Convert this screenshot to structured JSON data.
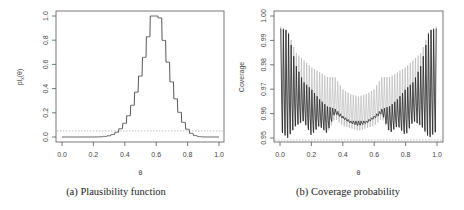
{
  "chart_data": [
    {
      "type": "line",
      "panel": "a",
      "caption": "(a)  Plausibility function",
      "title": "",
      "xlabel": "θ",
      "ylabel": "pl_x(θ)",
      "xlim": [
        0,
        1
      ],
      "ylim": [
        0,
        1
      ],
      "xticks": [
        "0.0",
        "0.2",
        "0.4",
        "0.6",
        "0.8",
        "1.0"
      ],
      "yticks": [
        "0.0",
        "0.2",
        "0.4",
        "0.6",
        "0.8",
        "1.0"
      ],
      "reference_line": {
        "y": 0.05,
        "style": "dotted",
        "color": "#aaaaaa"
      },
      "series": [
        {
          "name": "plausibility",
          "color": "#444444",
          "style": "step",
          "x": [
            0.0,
            0.3,
            0.35,
            0.38,
            0.4,
            0.42,
            0.44,
            0.46,
            0.48,
            0.5,
            0.52,
            0.54,
            0.56,
            0.58,
            0.6,
            0.62,
            0.64,
            0.66,
            0.68,
            0.7,
            0.72,
            0.74,
            0.76,
            0.78,
            0.8,
            0.83,
            0.86,
            1.0
          ],
          "y": [
            0.0,
            0.003,
            0.01,
            0.03,
            0.05,
            0.08,
            0.13,
            0.19,
            0.27,
            0.37,
            0.49,
            0.62,
            0.77,
            1.0,
            1.0,
            0.83,
            0.67,
            0.52,
            0.38,
            0.27,
            0.18,
            0.11,
            0.06,
            0.03,
            0.015,
            0.004,
            0.0,
            0.0
          ]
        }
      ],
      "grid": false,
      "legend": null
    },
    {
      "type": "line",
      "panel": "b",
      "caption": "(b)  Coverage probability",
      "title": "",
      "xlabel": "θ",
      "ylabel": "Coverage",
      "xlim": [
        0,
        1
      ],
      "ylim": [
        0.95,
        1.0
      ],
      "xticks": [
        "0.0",
        "0.2",
        "0.4",
        "0.6",
        "0.8",
        "1.0"
      ],
      "yticks": [
        "0.95",
        "0.96",
        "0.97",
        "0.98",
        "0.99",
        "1.00"
      ],
      "reference_line": {
        "y": 0.95,
        "style": "dotted",
        "color": "#aaaaaa"
      },
      "series": [
        {
          "name": "coverage (upper, grey)",
          "color": "#b0b0b0",
          "envelope_x": [
            0.0,
            0.05,
            0.1,
            0.15,
            0.2,
            0.25,
            0.3,
            0.35,
            0.4,
            0.45,
            0.5,
            0.55,
            0.6,
            0.65,
            0.7,
            0.75,
            0.8,
            0.85,
            0.9,
            0.95,
            1.0
          ],
          "envelope_high": [
            0.996,
            0.994,
            0.985,
            0.982,
            0.979,
            0.977,
            0.975,
            0.975,
            0.97,
            0.968,
            0.967,
            0.968,
            0.97,
            0.975,
            0.975,
            0.977,
            0.979,
            0.982,
            0.985,
            0.994,
            0.996
          ],
          "envelope_low": [
            0.953,
            0.951,
            0.955,
            0.957,
            0.952,
            0.955,
            0.952,
            0.958,
            0.955,
            0.954,
            0.953,
            0.954,
            0.955,
            0.958,
            0.952,
            0.955,
            0.952,
            0.957,
            0.955,
            0.951,
            0.953
          ]
        },
        {
          "name": "coverage (lower, black)",
          "color": "#222222",
          "envelope_x": [
            0.0,
            0.05,
            0.1,
            0.15,
            0.2,
            0.25,
            0.3,
            0.35,
            0.4,
            0.45,
            0.5,
            0.55,
            0.6,
            0.65,
            0.7,
            0.75,
            0.8,
            0.85,
            0.9,
            0.95,
            1.0
          ],
          "envelope_high": [
            0.995,
            0.994,
            0.98,
            0.973,
            0.97,
            0.966,
            0.963,
            0.962,
            0.959,
            0.957,
            0.957,
            0.957,
            0.959,
            0.962,
            0.963,
            0.966,
            0.97,
            0.973,
            0.98,
            0.994,
            0.995
          ],
          "envelope_low": [
            0.953,
            0.95,
            0.955,
            0.957,
            0.951,
            0.955,
            0.952,
            0.96,
            0.958,
            0.956,
            0.955,
            0.956,
            0.958,
            0.96,
            0.952,
            0.955,
            0.951,
            0.957,
            0.955,
            0.95,
            0.953
          ]
        }
      ],
      "grid": false,
      "legend": null
    }
  ]
}
